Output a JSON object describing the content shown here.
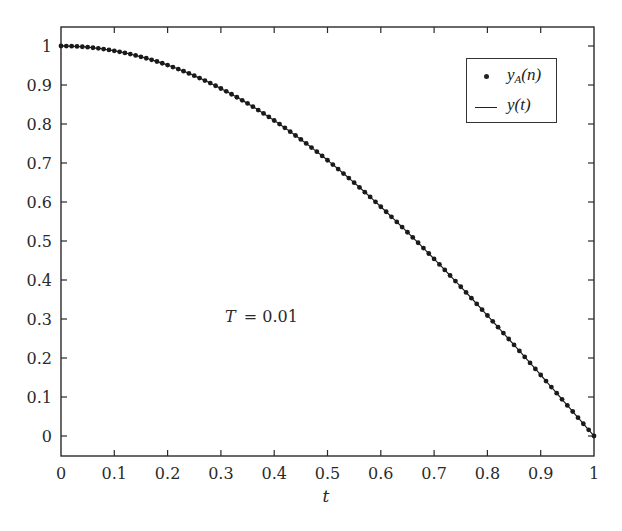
{
  "chart_data": {
    "type": "line",
    "title": "",
    "xlabel": "t",
    "ylabel": "",
    "xlim": [
      0,
      1
    ],
    "ylim": [
      -0.05,
      1.05
    ],
    "xticks": [
      "0",
      "0.1",
      "0.2",
      "0.3",
      "0.4",
      "0.5",
      "0.6",
      "0.7",
      "0.8",
      "0.9",
      "1"
    ],
    "yticks": [
      "0",
      "0.1",
      "0.2",
      "0.3",
      "0.4",
      "0.5",
      "0.6",
      "0.7",
      "0.8",
      "0.9",
      "1"
    ],
    "grid": false,
    "legend_position": "upper right",
    "annotation": "T = 0.01",
    "series": [
      {
        "name": "y_A(n)",
        "style": "dots",
        "sampling_T": 0.01,
        "x_start": 0,
        "x_end": 1,
        "n_points": 101,
        "approx_function": "cos(pi*t/2)",
        "sample_values": {
          "0": 1.0,
          "0.1": 0.988,
          "0.2": 0.951,
          "0.3": 0.891,
          "0.4": 0.809,
          "0.5": 0.72,
          "0.6": 0.588,
          "0.7": 0.46,
          "0.8": 0.309,
          "0.9": 0.156,
          "1": 0.0
        }
      },
      {
        "name": "y(t)",
        "style": "line",
        "approx_function": "cos(pi*t/2)",
        "sample_values": {
          "0": 1.0,
          "0.1": 0.988,
          "0.2": 0.951,
          "0.3": 0.891,
          "0.4": 0.809,
          "0.5": 0.72,
          "0.6": 0.588,
          "0.7": 0.46,
          "0.8": 0.309,
          "0.9": 0.156,
          "1": 0.0
        }
      }
    ]
  },
  "legend": {
    "item1_main": "y",
    "item1_sub": "A",
    "item1_tail": "(n)",
    "item2": "y(t)"
  },
  "annotation": {
    "T_label": "T",
    "T_value": "= 0.01"
  },
  "axes": {
    "xlabel": "t"
  }
}
